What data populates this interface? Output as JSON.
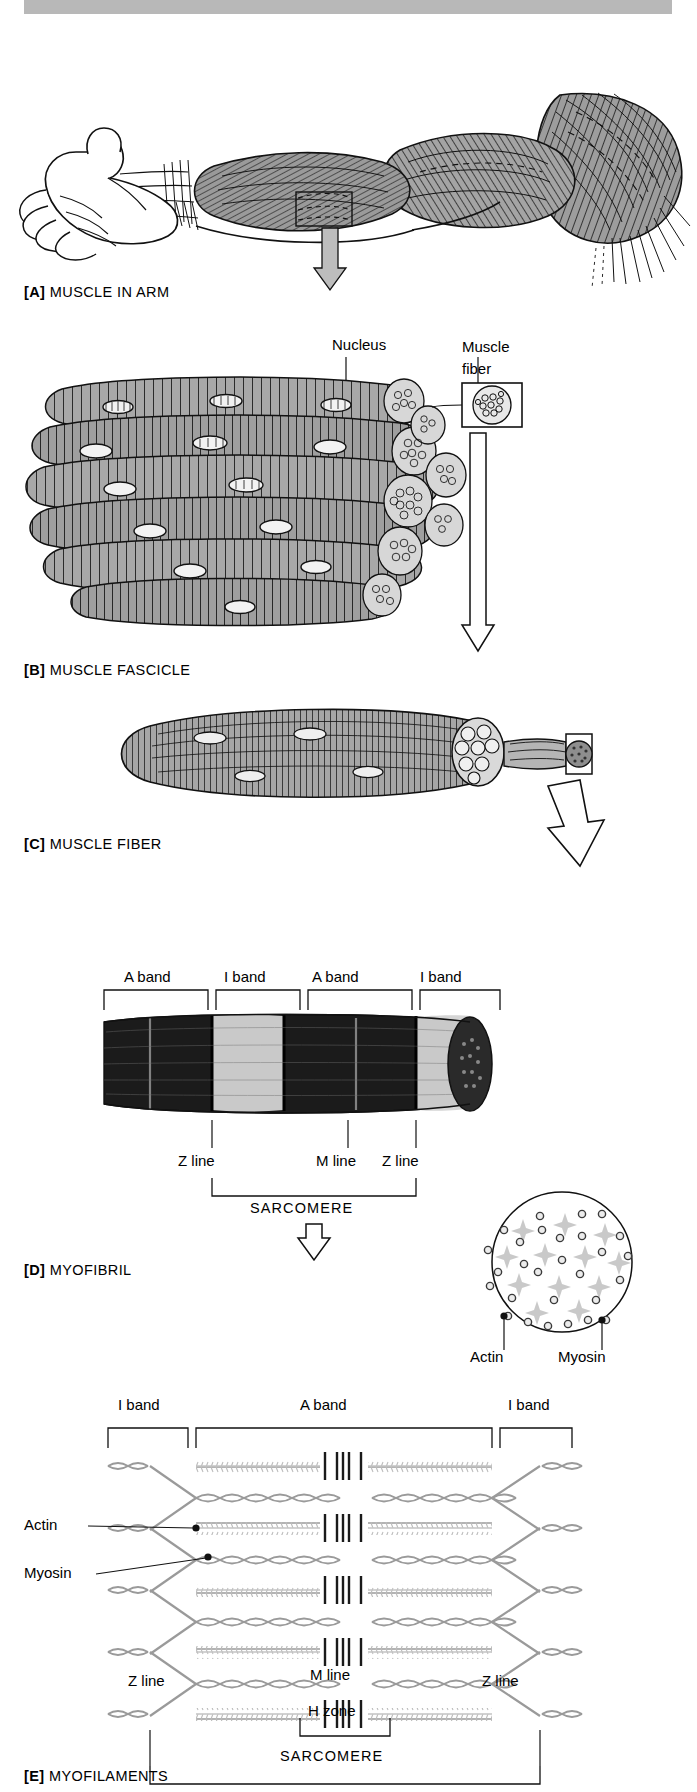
{
  "figure": {
    "title_bar": "",
    "panels": [
      {
        "id": "A",
        "tag": "[A]",
        "label": "MUSCLE IN ARM"
      },
      {
        "id": "B",
        "tag": "[B]",
        "label": "MUSCLE FASCICLE"
      },
      {
        "id": "C",
        "tag": "[C]",
        "label": "MUSCLE FIBER"
      },
      {
        "id": "D",
        "tag": "[D]",
        "label": "MYOFIBRIL"
      },
      {
        "id": "E",
        "tag": "[E]",
        "label": "MYOFILAMENTS"
      }
    ]
  },
  "panel_b": {
    "callouts": [
      {
        "name": "nucleus",
        "text": "Nucleus"
      },
      {
        "name": "muscle-fiber",
        "line1": "Muscle",
        "line2": "fiber"
      }
    ]
  },
  "panel_d": {
    "bands": [
      "A band",
      "I band",
      "A band",
      "I band"
    ],
    "lines": [
      "Z line",
      "M line",
      "Z line"
    ],
    "sarcomere": "SARCOMERE",
    "cross_section": {
      "actin_label": "Actin",
      "myosin_label": "Myosin",
      "actin_color": "#4a4a4a",
      "myosin_color": "#c9c9c9"
    }
  },
  "panel_e": {
    "bands": [
      "I band",
      "A band",
      "I band"
    ],
    "filament_labels": [
      {
        "name": "actin",
        "text": "Actin"
      },
      {
        "name": "myosin",
        "text": "Myosin"
      }
    ],
    "lines": [
      "Z line",
      "Z line"
    ],
    "m_line": "M line",
    "h_zone": "H zone",
    "sarcomere": "SARCOMERE"
  },
  "colors": {
    "bar_gray": "#b8b8b8",
    "arrow_fill": "#bdbdbd",
    "ink": "#111111",
    "muscle_fill": "#9a9a9a",
    "filament_gray": "#9e9e9e"
  }
}
